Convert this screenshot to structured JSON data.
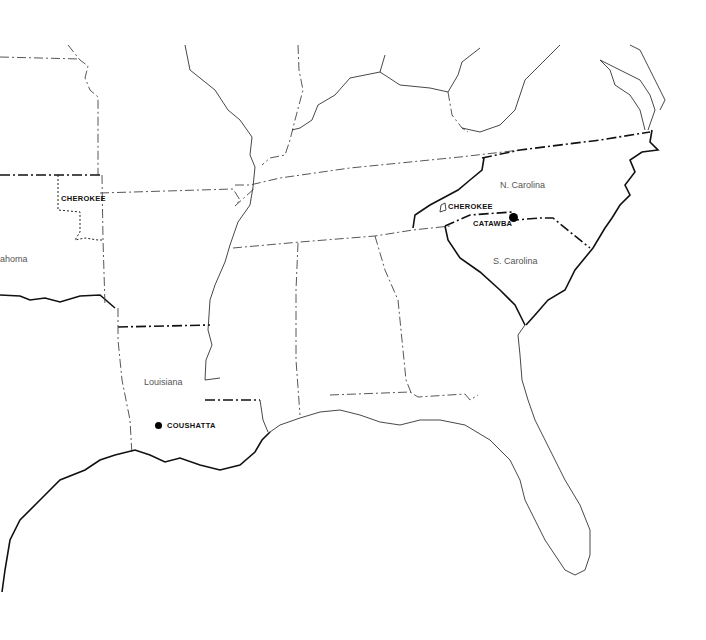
{
  "map": {
    "title": "",
    "states": [
      {
        "id": "oklahoma",
        "label": "ahoma"
      },
      {
        "id": "louisiana",
        "label": "Louisiana"
      },
      {
        "id": "north-carolina",
        "label": "N. Carolina"
      },
      {
        "id": "south-carolina",
        "label": "S. Carolina"
      }
    ],
    "tribes": [
      {
        "id": "cherokee-oklahoma",
        "label": "CHEROKEE",
        "marker": "dotted-boundary"
      },
      {
        "id": "cherokee-nc",
        "label": "CHEROKEE",
        "marker": "outline-shape"
      },
      {
        "id": "catawba",
        "label": "CATAWBA",
        "marker": "dot"
      },
      {
        "id": "coushatta",
        "label": "COUSHATTA",
        "marker": "dot"
      }
    ],
    "colors": {
      "line": "#333333",
      "bold_line": "#111111",
      "background": "#ffffff"
    }
  }
}
